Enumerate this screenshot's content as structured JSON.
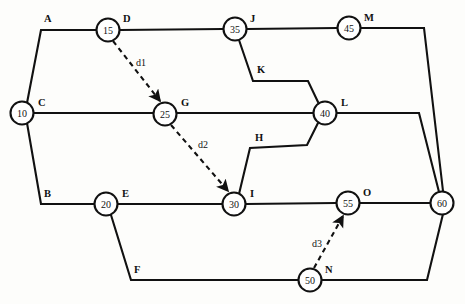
{
  "diagram": {
    "type": "activity-on-arrow-network",
    "title": "",
    "nodes": [
      {
        "id": "n10",
        "label": "10",
        "x": 22,
        "y": 113,
        "r": 11.5
      },
      {
        "id": "n15",
        "label": "15",
        "x": 108,
        "y": 30,
        "r": 11.5
      },
      {
        "id": "n20",
        "label": "20",
        "x": 106,
        "y": 204,
        "r": 11.5
      },
      {
        "id": "n25",
        "label": "25",
        "x": 165,
        "y": 114,
        "r": 11.5
      },
      {
        "id": "n30",
        "label": "30",
        "x": 234,
        "y": 204,
        "r": 11.5
      },
      {
        "id": "n35",
        "label": "35",
        "x": 235,
        "y": 29,
        "r": 11.5
      },
      {
        "id": "n40",
        "label": "40",
        "x": 325,
        "y": 113,
        "r": 11.5
      },
      {
        "id": "n45",
        "label": "45",
        "x": 349,
        "y": 28,
        "r": 11.5
      },
      {
        "id": "n50",
        "label": "50",
        "x": 310,
        "y": 280,
        "r": 11.5
      },
      {
        "id": "n55",
        "label": "55",
        "x": 348,
        "y": 203,
        "r": 11.5
      },
      {
        "id": "n60",
        "label": "60",
        "x": 442,
        "y": 203,
        "r": 11.5
      }
    ],
    "activities": [
      {
        "id": "A",
        "label": "A",
        "from": "n10",
        "to": "n15",
        "path": "M 27,103 L 41,30 L 96,30",
        "label_x": 44,
        "label_y": 22
      },
      {
        "id": "B",
        "label": "B",
        "from": "n10",
        "to": "n20",
        "path": "M 27,123 L 41,204 L 94,204",
        "label_x": 44,
        "label_y": 197
      },
      {
        "id": "C",
        "label": "C",
        "from": "n10",
        "to": "n25",
        "path": "M 34,113 L 153,113",
        "label_x": 38,
        "label_y": 106
      },
      {
        "id": "D",
        "label": "D",
        "from": "n15",
        "to": "n35",
        "path": "M 120,30 L 223,29",
        "label_x": 123,
        "label_y": 22
      },
      {
        "id": "E",
        "label": "E",
        "from": "n20",
        "to": "n30",
        "path": "M 118,204 L 222,204",
        "label_x": 122,
        "label_y": 197
      },
      {
        "id": "F",
        "label": "F",
        "from": "n20",
        "to": "n50",
        "path": "M 111,215 L 131,280 L 298,280",
        "label_x": 134,
        "label_y": 273
      },
      {
        "id": "G",
        "label": "G",
        "from": "n25",
        "to": "n40",
        "path": "M 177,113 L 313,113",
        "label_x": 181,
        "label_y": 106
      },
      {
        "id": "H",
        "label": "H",
        "from": "n40",
        "to": "n30",
        "path": "M 318,123 L 307,145 L 250,148 L 239,194",
        "label_x": 255,
        "label_y": 141
      },
      {
        "id": "I",
        "label": "I",
        "from": "n30",
        "to": "n55",
        "path": "M 246,204 L 336,203",
        "label_x": 250,
        "label_y": 197
      },
      {
        "id": "J",
        "label": "J",
        "from": "n35",
        "to": "n45",
        "path": "M 247,29 L 337,28",
        "label_x": 250,
        "label_y": 22
      },
      {
        "id": "K",
        "label": "K",
        "from": "n35",
        "to": "n40",
        "path": "M 239,40 L 253,81 L 308,81 L 318,102",
        "label_x": 257,
        "label_y": 73
      },
      {
        "id": "L",
        "label": "L",
        "from": "n40",
        "to": "n60",
        "path": "M 337,113 L 419,113 L 439,192",
        "label_x": 341,
        "label_y": 106
      },
      {
        "id": "M",
        "label": "M",
        "from": "n45",
        "to": "n60",
        "path": "M 361,28 L 424,28 L 443,191",
        "label_x": 364,
        "label_y": 21
      },
      {
        "id": "N",
        "label": "N",
        "from": "n50",
        "to": "n60",
        "path": "M 322,280 L 427,280 L 443,214",
        "label_x": 325,
        "label_y": 273
      },
      {
        "id": "O",
        "label": "O",
        "from": "n55",
        "to": "n60",
        "path": "M 360,203 L 430,203",
        "label_x": 363,
        "label_y": 196
      }
    ],
    "dummy_activities": [
      {
        "id": "d1",
        "label": "d1",
        "from": "n15",
        "to": "n25",
        "x1": 113,
        "y1": 41,
        "x2": 160,
        "y2": 101,
        "label_x": 136,
        "label_y": 66
      },
      {
        "id": "d2",
        "label": "d2",
        "from": "n25",
        "to": "n30",
        "x1": 171,
        "y1": 125,
        "x2": 228,
        "y2": 191,
        "label_x": 198,
        "label_y": 148
      },
      {
        "id": "d3",
        "label": "d3",
        "from": "n50",
        "to": "n55",
        "x1": 314,
        "y1": 268,
        "x2": 343,
        "y2": 216,
        "label_x": 312,
        "label_y": 247
      }
    ],
    "colors": {
      "stroke": "#111111",
      "node_fill": "#ffffff",
      "background": "#fdfdfb"
    }
  }
}
